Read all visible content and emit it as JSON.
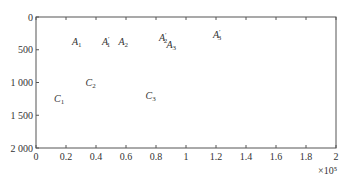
{
  "chart_data": {
    "type": "line",
    "title": "",
    "xlabel": "",
    "ylabel": "",
    "x_multiplier_label": "×10⁵",
    "xlim": [
      0,
      2
    ],
    "ylim": [
      2000,
      0
    ],
    "y_inverted": true,
    "grid": false,
    "legend": null,
    "x_ticks": [
      0,
      0.2,
      0.4,
      0.6,
      0.8,
      1,
      1.2,
      1.4,
      1.6,
      1.8,
      2
    ],
    "x_tick_labels": [
      "0",
      "0.2",
      "0.4",
      "0.6",
      "0.8",
      "1",
      "1.2",
      "1.4",
      "1.6",
      "1.8",
      "2"
    ],
    "y_ticks": [
      0,
      500,
      1000,
      1500,
      2000
    ],
    "y_tick_labels": [
      "0",
      "500",
      "1 000",
      "1 500",
      "2 000"
    ],
    "series_model": {
      "description": "Bundle of oscillating curves (period ~0.35×10⁵) that fan out in phase as x increases",
      "count": 8,
      "base_period": 0.35,
      "period_spread": 0.012,
      "mid_value": 1000,
      "amplitude": 870,
      "amplitude_growth": -0.03,
      "start_phase_value": 100
    },
    "series": [
      {
        "name": "curve 1",
        "period": 0.35
      },
      {
        "name": "curve 2",
        "period": 0.362
      },
      {
        "name": "curve 3",
        "period": 0.374
      },
      {
        "name": "curve 4",
        "period": 0.386
      },
      {
        "name": "curve 5",
        "period": 0.398
      },
      {
        "name": "curve 6",
        "period": 0.41
      },
      {
        "name": "curve 7",
        "period": 0.422
      },
      {
        "name": "curve 8",
        "period": 0.434
      }
    ],
    "annotations": [
      {
        "label": "A",
        "sub": "1",
        "prime": false,
        "x": 0.24,
        "y": 420
      },
      {
        "label": "A",
        "sub": "1",
        "prime": true,
        "x": 0.44,
        "y": 420
      },
      {
        "label": "A",
        "sub": "2",
        "prime": false,
        "x": 0.55,
        "y": 420
      },
      {
        "label": "A",
        "sub": "2",
        "prime": true,
        "x": 0.82,
        "y": 360
      },
      {
        "label": "A",
        "sub": "3",
        "prime": false,
        "x": 0.87,
        "y": 480
      },
      {
        "label": "A",
        "sub": "3",
        "prime": true,
        "x": 1.18,
        "y": 320
      },
      {
        "label": "C",
        "sub": "1",
        "prime": false,
        "x": 0.12,
        "y": 1300
      },
      {
        "label": "C",
        "sub": "2",
        "prime": false,
        "x": 0.33,
        "y": 1050
      },
      {
        "label": "C",
        "sub": "3",
        "prime": false,
        "x": 0.73,
        "y": 1250
      }
    ]
  },
  "colors": {
    "curve_dark": "#1a1a1a",
    "curve_light": "#6a6a6a",
    "axis": "#555555"
  }
}
